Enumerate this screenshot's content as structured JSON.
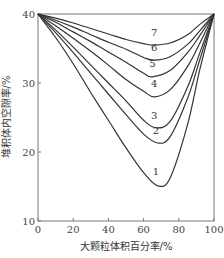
{
  "chart_data": {
    "type": "line",
    "title": "",
    "xlabel": "大颗粒体积百分率/%",
    "ylabel": "堆积体内空隙率/%",
    "xlim": [
      0,
      100
    ],
    "ylim": [
      10,
      40
    ],
    "xticks": [
      0,
      20,
      40,
      60,
      80,
      100
    ],
    "yticks": [
      10,
      20,
      30,
      40
    ],
    "grid": false,
    "legend": "inline curve labels",
    "series": [
      {
        "name": "1",
        "x": [
          0,
          10,
          20,
          30,
          40,
          50,
          60,
          68,
          75,
          85,
          92,
          100
        ],
        "values": [
          40,
          36.6,
          32.8,
          28.6,
          24.6,
          20.6,
          17.0,
          15.1,
          16.2,
          24.0,
          32.0,
          40
        ]
      },
      {
        "name": "2",
        "x": [
          0,
          10,
          20,
          30,
          40,
          50,
          60,
          68,
          75,
          85,
          92,
          100
        ],
        "values": [
          40,
          37.3,
          34.4,
          31.4,
          28.4,
          25.4,
          22.6,
          21.3,
          22.2,
          27.8,
          33.4,
          40
        ]
      },
      {
        "name": "3",
        "x": [
          0,
          10,
          20,
          30,
          40,
          50,
          60,
          67,
          75,
          85,
          92,
          100
        ],
        "values": [
          40,
          37.7,
          35.2,
          32.6,
          30.0,
          27.4,
          24.6,
          23.5,
          24.4,
          29.4,
          34.4,
          40
        ]
      },
      {
        "name": "4",
        "x": [
          0,
          10,
          20,
          30,
          40,
          50,
          60,
          66,
          75,
          85,
          92,
          100
        ],
        "values": [
          40,
          38.3,
          36.5,
          34.6,
          32.6,
          30.5,
          28.8,
          28.0,
          29.0,
          32.4,
          35.8,
          40
        ]
      },
      {
        "name": "5",
        "x": [
          0,
          10,
          20,
          30,
          40,
          50,
          60,
          65,
          75,
          85,
          92,
          100
        ],
        "values": [
          40,
          38.8,
          37.4,
          36.0,
          34.5,
          33.0,
          31.4,
          30.9,
          31.8,
          34.4,
          36.9,
          40
        ]
      },
      {
        "name": "6",
        "x": [
          0,
          10,
          20,
          30,
          40,
          50,
          60,
          66,
          75,
          85,
          92,
          100
        ],
        "values": [
          40,
          39.1,
          38.1,
          37.0,
          35.9,
          34.9,
          33.7,
          33.3,
          33.8,
          35.6,
          37.6,
          40
        ]
      },
      {
        "name": "7",
        "x": [
          0,
          10,
          20,
          30,
          40,
          50,
          60,
          66,
          75,
          85,
          92,
          100
        ],
        "values": [
          40,
          39.4,
          38.7,
          37.9,
          37.1,
          36.3,
          35.7,
          35.5,
          35.8,
          37.0,
          38.5,
          40
        ]
      }
    ],
    "curve_labels": [
      {
        "text": "1",
        "x": 67,
        "y": 16.6
      },
      {
        "text": "2",
        "x": 67,
        "y": 22.6
      },
      {
        "text": "3",
        "x": 66,
        "y": 24.8
      },
      {
        "text": "4",
        "x": 66,
        "y": 29.4
      },
      {
        "text": "5",
        "x": 65,
        "y": 32.3
      },
      {
        "text": "6",
        "x": 66,
        "y": 34.6
      },
      {
        "text": "7",
        "x": 66,
        "y": 36.8
      }
    ]
  },
  "labels": {
    "xlabel": "大颗粒体积百分率/%",
    "ylabel": "堆积体内空隙率/%"
  }
}
